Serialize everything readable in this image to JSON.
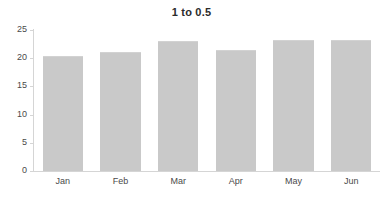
{
  "chart_data": {
    "type": "bar",
    "title": "1 to 0.5",
    "subtitle": "",
    "xlabel": "",
    "ylabel": "",
    "categories": [
      "Jan",
      "Feb",
      "Mar",
      "Apr",
      "May",
      "Jun"
    ],
    "values": [
      20.4,
      21.1,
      23.1,
      21.5,
      23.2,
      23.2
    ],
    "series": [
      {
        "name": "",
        "values": [
          20.4,
          21.1,
          23.1,
          21.5,
          23.2,
          23.2
        ]
      }
    ],
    "ylim": [
      0,
      25
    ],
    "y_ticks": [
      0,
      5,
      10,
      15,
      20,
      25
    ],
    "y_tick_labels": [
      "0",
      "5",
      "10",
      "15",
      "20",
      "25"
    ],
    "grid": false,
    "legend": "none",
    "bar_color": "#c9c9c9",
    "axis_color": "#d5d5d5",
    "text_color": "#4a4a4a",
    "title_color": "#2b2b2b",
    "background": "#ffffff"
  }
}
